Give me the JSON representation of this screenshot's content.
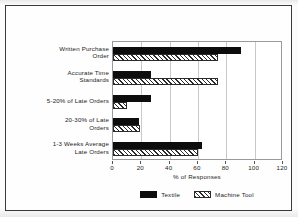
{
  "chart_data": {
    "type": "bar",
    "orientation": "horizontal",
    "title": "",
    "xlabel": "% of Responses",
    "ylabel": "",
    "xlim": [
      0,
      120
    ],
    "xticks": [
      0,
      20,
      40,
      60,
      80,
      100,
      120
    ],
    "grid": true,
    "legend_position": "bottom",
    "categories": [
      "Written Purchase\nOrder",
      "Accurate Time\nStandards",
      "5-20% of Late Orders",
      "20-30% of Late\nOrders",
      "1-3 Weeks Average\nLate Orders"
    ],
    "series": [
      {
        "name": "Textile",
        "color": "#0d0d0d",
        "pattern": "solid",
        "values": [
          90,
          27,
          27,
          18,
          63
        ]
      },
      {
        "name": "Machine Tool",
        "color": "#2b2b2b",
        "pattern": "diagonal-hatch",
        "values": [
          74,
          74,
          10,
          19,
          60
        ]
      }
    ]
  },
  "axis": {
    "tick_labels": [
      "0",
      "20",
      "40",
      "60",
      "80",
      "100",
      "120"
    ],
    "x_title": "% of Responses"
  },
  "legend": {
    "items": [
      {
        "label": "Textile"
      },
      {
        "label": "Machine Tool"
      }
    ]
  }
}
